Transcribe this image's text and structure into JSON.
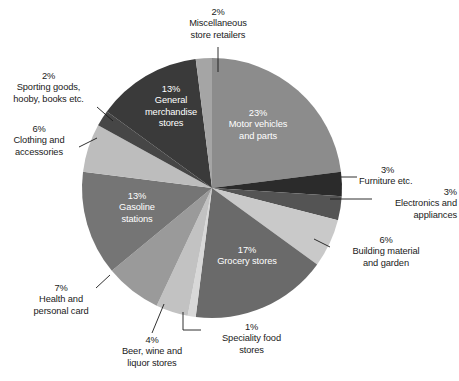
{
  "chart_data": {
    "type": "pie",
    "title": "",
    "subtitle": "",
    "xlabel": "",
    "ylabel": "",
    "legend_position": "none",
    "grid": false,
    "units": "percent",
    "total": 100,
    "categories": [
      "Motor vehicles and parts",
      "Furniture etc.",
      "Electronics and appliances",
      "Building material and garden",
      "Grocery stores",
      "Speciality food stores",
      "Beer, wine and liquor stores",
      "Health and personal card",
      "Gasoline stations",
      "Clothing and accessories",
      "Sporting goods, hooby, books etc.",
      "General merchandise stores",
      "Miscellaneous store retailers"
    ],
    "values": [
      23,
      3,
      3,
      6,
      17,
      1,
      4,
      7,
      13,
      6,
      2,
      13,
      2
    ],
    "colors": [
      "#8c8c8c",
      "#2b2b2b",
      "#545454",
      "#c9c9c9",
      "#6a6a6a",
      "#d8d8d8",
      "#c2c2c2",
      "#9a9a9a",
      "#757575",
      "#bdbdbd",
      "#464646",
      "#3a3a3a",
      "#a5a5a5"
    ],
    "slices": [
      {
        "label": "Motor vehicles and parts",
        "percent_text": "23%",
        "value": 23,
        "color": "#8c8c8c",
        "label_placement": "inside",
        "label_lines": [
          "23%",
          "Motor vehicles",
          "and parts"
        ]
      },
      {
        "label": "Furniture etc.",
        "percent_text": "3%",
        "value": 3,
        "color": "#2b2b2b",
        "label_placement": "callout-right",
        "label_lines": [
          "3%",
          "Furniture etc."
        ]
      },
      {
        "label": "Electronics and appliances",
        "percent_text": "3%",
        "value": 3,
        "color": "#545454",
        "label_placement": "callout-right",
        "label_lines": [
          "3%",
          "Electronics and",
          "appliances"
        ]
      },
      {
        "label": "Building material and garden",
        "percent_text": "6%",
        "value": 6,
        "color": "#c9c9c9",
        "label_placement": "callout-right",
        "label_lines": [
          "6%",
          "Building material",
          "and garden"
        ]
      },
      {
        "label": "Grocery stores",
        "percent_text": "17%",
        "value": 17,
        "color": "#6a6a6a",
        "label_placement": "inside",
        "label_lines": [
          "17%",
          "Grocery stores"
        ]
      },
      {
        "label": "Speciality food stores",
        "percent_text": "1%",
        "value": 1,
        "color": "#d8d8d8",
        "label_placement": "callout-bottom",
        "label_lines": [
          "1%",
          "Speciality food",
          "stores"
        ]
      },
      {
        "label": "Beer, wine and liquor stores",
        "percent_text": "4%",
        "value": 4,
        "color": "#c2c2c2",
        "label_placement": "callout-bottom",
        "label_lines": [
          "4%",
          "Beer, wine and",
          "liquor stores"
        ]
      },
      {
        "label": "Health and personal card",
        "percent_text": "7%",
        "value": 7,
        "color": "#9a9a9a",
        "label_placement": "callout-left",
        "label_lines": [
          "7%",
          "Health and",
          "personal card"
        ]
      },
      {
        "label": "Gasoline stations",
        "percent_text": "13%",
        "value": 13,
        "color": "#757575",
        "label_placement": "inside",
        "label_lines": [
          "13%",
          "Gasoline",
          "stations"
        ]
      },
      {
        "label": "Clothing and accessories",
        "percent_text": "6%",
        "value": 6,
        "color": "#bdbdbd",
        "label_placement": "callout-left",
        "label_lines": [
          "6%",
          "Clothing and",
          "accessories"
        ]
      },
      {
        "label": "Sporting goods, hooby, books etc.",
        "percent_text": "2%",
        "value": 2,
        "color": "#464646",
        "label_placement": "callout-left",
        "label_lines": [
          "2%",
          "Sporting goods,",
          "hooby, books etc."
        ]
      },
      {
        "label": "General merchandise stores",
        "percent_text": "13%",
        "value": 13,
        "color": "#3a3a3a",
        "label_placement": "inside",
        "label_lines": [
          "13%",
          "General",
          "merchandise",
          "stores"
        ]
      },
      {
        "label": "Miscellaneous store retailers",
        "percent_text": "2%",
        "value": 2,
        "color": "#a5a5a5",
        "label_placement": "callout-top",
        "label_lines": [
          "2%",
          "Miscellaneous",
          "store retailers"
        ]
      }
    ]
  },
  "labels": {
    "misc": {
      "l1": "2%",
      "l2": "Miscellaneous",
      "l3": "store retailers"
    },
    "sporting": {
      "l1": "2%",
      "l2": "Sporting goods,",
      "l3": "hooby, books etc."
    },
    "clothing": {
      "l1": "6%",
      "l2": "Clothing and",
      "l3": "accessories"
    },
    "furniture": {
      "l1": "3%",
      "l2": "Furniture etc."
    },
    "electronics": {
      "l1": "3%",
      "l2": "Electronics and",
      "l3": "appliances"
    },
    "building": {
      "l1": "6%",
      "l2": "Building material",
      "l3": "and garden"
    },
    "speciality": {
      "l1": "1%",
      "l2": "Speciality food",
      "l3": "stores"
    },
    "beer": {
      "l1": "4%",
      "l2": "Beer, wine and",
      "l3": "liquor stores"
    },
    "health": {
      "l1": "7%",
      "l2": "Health and",
      "l3": "personal card"
    },
    "motor": {
      "l1": "23%",
      "l2": "Motor vehicles",
      "l3": "and parts"
    },
    "general": {
      "l1": "13%",
      "l2": "General",
      "l3": "merchandise",
      "l4": "stores"
    },
    "gasoline": {
      "l1": "13%",
      "l2": "Gasoline",
      "l3": "stations"
    },
    "grocery": {
      "l1": "17%",
      "l2": "Grocery stores"
    }
  }
}
